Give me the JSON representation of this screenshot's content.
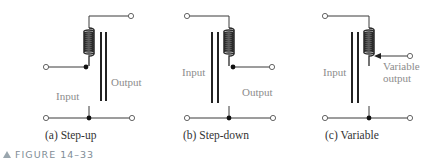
{
  "figure": {
    "label": "FIGURE 14–33",
    "marker_icon": "triangle-icon"
  },
  "panels": [
    {
      "id": "a",
      "caption": "(a) Step-up",
      "labels": {
        "input": "Input",
        "output": "Output"
      },
      "type": "step-up autotransformer",
      "tap": "input tapped from winding; output across full winding"
    },
    {
      "id": "b",
      "caption": "(b) Step-down",
      "labels": {
        "input": "Input",
        "output": "Output"
      },
      "type": "step-down autotransformer",
      "tap": "input across full winding; output tapped from winding"
    },
    {
      "id": "c",
      "caption": "(c) Variable",
      "labels": {
        "input": "Input",
        "output_line1": "Variable",
        "output_line2": "output"
      },
      "type": "variable autotransformer",
      "tap": "sliding arrow tap for variable output"
    }
  ],
  "colors": {
    "wire": "#3a3a3a",
    "label": "#8c8c8c",
    "caption": "#333333",
    "figure_label": "#7f8c96"
  }
}
